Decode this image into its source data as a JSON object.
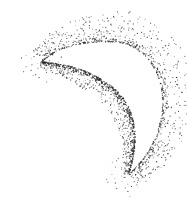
{
  "image": {
    "subject": "stippled crescent moon",
    "width": 187,
    "height": 212,
    "background": "#ffffff",
    "ink": "#2a2a2a"
  },
  "crescent": {
    "outer_path": "M42,62 C60,44 92,40 122,43 C150,50 166,80 162,112 C158,140 145,160 128,175",
    "inner_path": "M128,175 C138,150 138,122 126,102 C112,80 80,64 42,62",
    "horn_left": [
      42,
      62
    ],
    "horn_bottom": [
      128,
      175
    ]
  },
  "stipple": {
    "seed": 7,
    "edge_dots": 900,
    "outer_spray_dots": 520,
    "inner_spray_dots": 380,
    "outer_spray_width": 22,
    "inner_spray_width": 14
  }
}
